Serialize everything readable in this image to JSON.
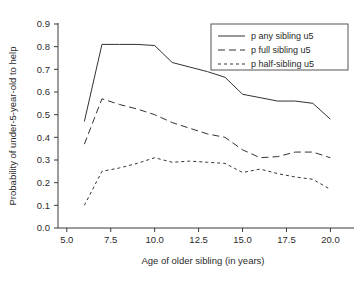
{
  "chart_data": {
    "type": "line",
    "title": "",
    "xlabel": "Age of older sibling (in years)",
    "ylabel": "Probability of under-5-year-old to help",
    "xlim": [
      4.5,
      21.0
    ],
    "ylim": [
      0.0,
      0.93
    ],
    "grid": false,
    "legend_position": "top-right",
    "xticks": [
      "5.0",
      "7.5",
      "10.0",
      "12.5",
      "15.0",
      "17.5",
      "20.0"
    ],
    "xtick_values": [
      5.0,
      7.5,
      10.0,
      12.5,
      15.0,
      17.5,
      20.0
    ],
    "yticks": [
      "0.0",
      "0.1",
      "0.2",
      "0.3",
      "0.4",
      "0.5",
      "0.6",
      "0.7",
      "0.8",
      "0.9"
    ],
    "ytick_values": [
      0.0,
      0.1,
      0.2,
      0.3,
      0.4,
      0.5,
      0.6,
      0.7,
      0.8,
      0.9
    ],
    "x": [
      6,
      7,
      8,
      9,
      10,
      11,
      12,
      13,
      14,
      15,
      16,
      17,
      18,
      19,
      20
    ],
    "series": [
      {
        "name": "p any sibling u5",
        "dash": "none",
        "values": [
          0.47,
          0.81,
          0.81,
          0.81,
          0.805,
          0.73,
          0.71,
          0.69,
          0.665,
          0.59,
          0.575,
          0.56,
          0.56,
          0.55,
          0.48
        ]
      },
      {
        "name": "p full sibling u5",
        "dash": "long",
        "values": [
          0.37,
          0.57,
          0.545,
          0.525,
          0.5,
          0.465,
          0.44,
          0.415,
          0.4,
          0.345,
          0.31,
          0.315,
          0.335,
          0.335,
          0.31
        ]
      },
      {
        "name": "p half-sibling u5",
        "dash": "short",
        "values": [
          0.1,
          0.25,
          0.265,
          0.285,
          0.31,
          0.29,
          0.295,
          0.29,
          0.285,
          0.245,
          0.26,
          0.24,
          0.225,
          0.215,
          0.17
        ]
      }
    ]
  },
  "legend": {
    "entries": [
      {
        "label": "p any sibling u5"
      },
      {
        "label": "p full sibling u5"
      },
      {
        "label": "p half-sibling u5"
      }
    ]
  },
  "colors": {
    "line": "#333333",
    "axis": "#3a3a3a",
    "text": "#2b2b2b",
    "background": "#ffffff"
  }
}
